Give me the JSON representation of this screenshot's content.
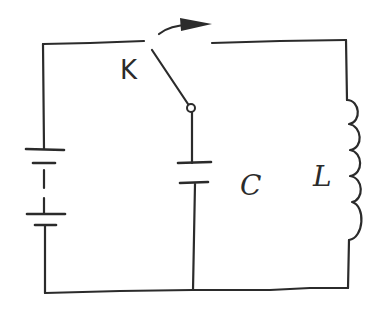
{
  "diagram": {
    "type": "circuit-schematic",
    "style": "hand-drawn",
    "colors": {
      "ink": "#2b2b2b",
      "background": "#ffffff"
    },
    "labels": {
      "switch": "K",
      "capacitor": "C",
      "inductor": "L"
    },
    "components": [
      {
        "id": "battery",
        "kind": "battery",
        "cells": 2,
        "position": "left branch"
      },
      {
        "id": "switch",
        "kind": "switch",
        "label": "K",
        "state": "opening (arrow indicates toggle toward right)"
      },
      {
        "id": "capacitor",
        "kind": "capacitor",
        "label": "C",
        "position": "middle branch"
      },
      {
        "id": "inductor",
        "kind": "inductor",
        "label": "L",
        "turns": 4,
        "position": "right branch"
      }
    ],
    "arrow": {
      "kind": "curved-arrow",
      "meaning": "switch moves to right contact"
    }
  }
}
